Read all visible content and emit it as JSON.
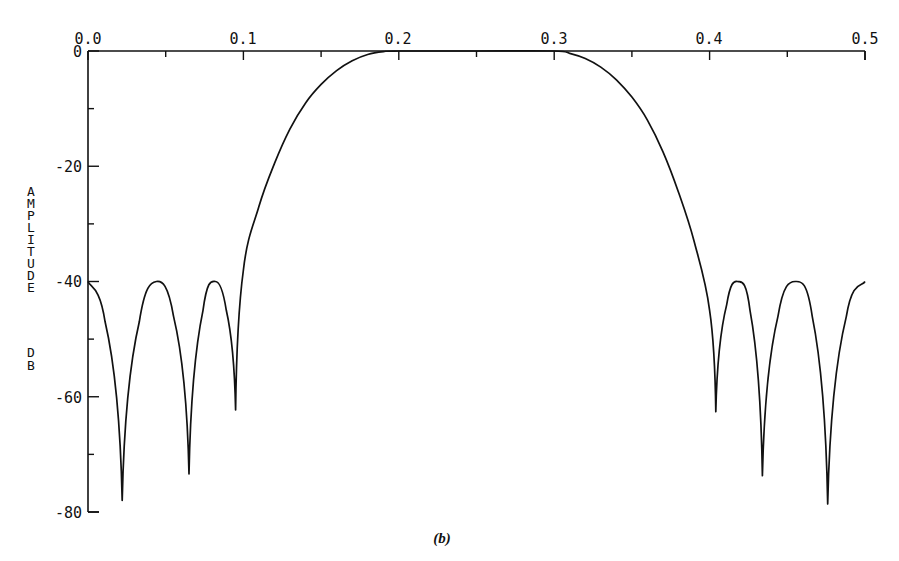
{
  "chart_data": {
    "type": "line",
    "title": "",
    "caption": "(b)",
    "xlabel": "",
    "ylabel": "AMPLITUDE DB",
    "xlim": [
      0.0,
      0.5
    ],
    "ylim": [
      -80,
      0
    ],
    "x_axis_position": "top",
    "x_ticks": [
      0.0,
      0.1,
      0.2,
      0.3,
      0.4,
      0.5
    ],
    "x_tick_labels": [
      "0.0",
      "0.1",
      "0.2",
      "0.3",
      "0.4",
      "0.5"
    ],
    "x_minor_ticks": [
      0.05,
      0.15,
      0.25,
      0.35,
      0.45
    ],
    "y_ticks": [
      0,
      -20,
      -40,
      -60,
      -80
    ],
    "y_tick_labels": [
      "0",
      "-20",
      "-40",
      "-60",
      "-80"
    ],
    "y_minor_ticks": [
      -10,
      -30,
      -50,
      -70
    ],
    "grid": false,
    "legend": null,
    "series": [
      {
        "name": "bandpass filter response",
        "description": "Equiripple bandpass: passband ~0.2-0.3 at 0 dB, stopband sidelobes at -40 dB",
        "x": [
          0.0,
          0.011,
          0.022,
          0.033,
          0.044,
          0.055,
          0.065,
          0.074,
          0.082,
          0.089,
          0.095,
          0.1,
          0.11,
          0.12,
          0.13,
          0.14,
          0.15,
          0.16,
          0.17,
          0.18,
          0.19,
          0.2,
          0.25,
          0.3,
          0.31,
          0.32,
          0.33,
          0.34,
          0.35,
          0.36,
          0.37,
          0.38,
          0.39,
          0.4,
          0.404,
          0.411,
          0.418,
          0.426,
          0.434,
          0.444,
          0.455,
          0.466,
          0.476,
          0.488,
          0.5
        ],
        "y": [
          -40,
          -47,
          -78,
          -47,
          -40,
          -46,
          -73.4,
          -45,
          -40,
          -45,
          -62.3,
          -38,
          -27,
          -19.5,
          -13.5,
          -9,
          -5.8,
          -3.4,
          -1.7,
          -0.6,
          -0.1,
          0,
          0,
          0,
          -0.4,
          -1.3,
          -2.8,
          -5,
          -8,
          -12,
          -17.5,
          -24.5,
          -33,
          -45,
          -62.6,
          -44,
          -40,
          -45,
          -73.7,
          -46,
          -40,
          -46,
          -78.6,
          -46,
          -40
        ]
      }
    ],
    "nulls": [
      {
        "x": 0.022,
        "y": -78
      },
      {
        "x": 0.065,
        "y": -73.4
      },
      {
        "x": 0.095,
        "y": -62.3
      },
      {
        "x": 0.404,
        "y": -62.6
      },
      {
        "x": 0.434,
        "y": -73.7
      },
      {
        "x": 0.476,
        "y": -78.6
      }
    ]
  },
  "labels": {
    "x_ticks": [
      "0.0",
      "0.1",
      "0.2",
      "0.3",
      "0.4",
      "0.5"
    ],
    "y_ticks": [
      "0",
      "-20",
      "-40",
      "-60",
      "-80"
    ],
    "ylabel_word1": [
      "A",
      "M",
      "P",
      "L",
      "I",
      "T",
      "U",
      "D",
      "E"
    ],
    "ylabel_word2": [
      "D",
      "B"
    ],
    "caption": "(b)"
  }
}
